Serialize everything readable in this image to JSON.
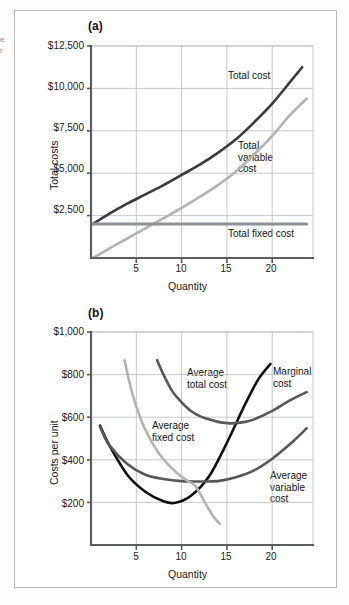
{
  "figure": {
    "edge_scrap_text": "e\nr",
    "panels": [
      {
        "id": "panel-a",
        "label": "(a)",
        "ylabel": "Total costs",
        "xlabel": "Quantity",
        "ytick_labels": [
          "$12,500",
          "$10,000",
          "$7,500",
          "$5,000",
          "$2,500"
        ],
        "xtick_labels": [
          "5",
          "10",
          "15",
          "20"
        ],
        "curve_labels": [
          {
            "name": "total-cost",
            "text": "Total cost"
          },
          {
            "name": "total-variable-cost",
            "text": "Total\nvariable\ncost"
          },
          {
            "name": "total-fixed-cost",
            "text": "Total fixed cost"
          }
        ]
      },
      {
        "id": "panel-b",
        "label": "(b)",
        "ylabel": "Costs per unit",
        "xlabel": "Quantity",
        "ytick_labels": [
          "$1,000",
          "$800",
          "$600",
          "$400",
          "$200"
        ],
        "xtick_labels": [
          "5",
          "10",
          "15",
          "20"
        ],
        "curve_labels": [
          {
            "name": "average-total-cost",
            "text": "Average\ntotal cost"
          },
          {
            "name": "marginal-cost",
            "text": "Marginal\ncost"
          },
          {
            "name": "average-fixed-cost",
            "text": "Average\nfixed cost"
          },
          {
            "name": "average-variable-cost",
            "text": "Average\nvariable\ncost"
          }
        ]
      }
    ]
  },
  "colors": {
    "dark": "#3b3b3b",
    "black": "#101010",
    "mid_gray": "#585858",
    "light_gray": "#b3b3b3",
    "grid": "#b7bbc0",
    "axis": "#5a5d61",
    "frame": "#b9bcc0"
  },
  "chart_data": [
    {
      "type": "line",
      "title": "(a)",
      "xlabel": "Quantity",
      "ylabel": "Total costs",
      "xlim": [
        0,
        24.5
      ],
      "ylim": [
        0,
        12500
      ],
      "xticks": [
        5,
        10,
        15,
        20
      ],
      "xtick_labels": [
        "5",
        "10",
        "15",
        "20"
      ],
      "yticks": [
        2500,
        5000,
        7500,
        10000,
        12500
      ],
      "ytick_labels": [
        "$2,500",
        "$5,000",
        "$7,500",
        "$10,000",
        "$12,500"
      ],
      "grid": true,
      "legend": "inline-annotations",
      "series": [
        {
          "name": "Total cost",
          "color": "#3b3b3b",
          "x": [
            0.2,
            2,
            4,
            6,
            8,
            10,
            12,
            14,
            16,
            18,
            20,
            22,
            23.3
          ],
          "values": [
            2000,
            2600,
            3200,
            3750,
            4300,
            4900,
            5500,
            6200,
            7000,
            8000,
            9100,
            10400,
            11250
          ]
        },
        {
          "name": "Total variable cost",
          "color": "#b3b3b3",
          "x": [
            0.2,
            2,
            4,
            6,
            8,
            10,
            12,
            14,
            16,
            18,
            20,
            22,
            23.8
          ],
          "values": [
            0,
            550,
            1150,
            1750,
            2350,
            2950,
            3600,
            4300,
            5100,
            6100,
            7200,
            8450,
            9400
          ]
        },
        {
          "name": "Total fixed cost",
          "color": "#8e9195",
          "x": [
            0.2,
            23.8
          ],
          "values": [
            2000,
            2000
          ]
        }
      ]
    },
    {
      "type": "line",
      "title": "(b)",
      "xlabel": "Quantity",
      "ylabel": "Costs per unit",
      "xlim": [
        0,
        24.5
      ],
      "ylim": [
        0,
        1000
      ],
      "xticks": [
        5,
        10,
        15,
        20
      ],
      "xtick_labels": [
        "5",
        "10",
        "15",
        "20"
      ],
      "yticks": [
        200,
        400,
        600,
        800,
        1000
      ],
      "ytick_labels": [
        "$200",
        "$400",
        "$600",
        "$800",
        "$1,000"
      ],
      "grid": true,
      "legend": "inline-annotations",
      "series": [
        {
          "name": "Marginal cost",
          "color": "#101010",
          "x": [
            1.0,
            2,
            4,
            6,
            8,
            9.3,
            11,
            13,
            15,
            17,
            18.5,
            19.8
          ],
          "values": [
            560,
            470,
            330,
            250,
            205,
            198,
            230,
            320,
            480,
            660,
            780,
            850
          ]
        },
        {
          "name": "Average variable cost",
          "color": "#585858",
          "x": [
            1.0,
            2,
            4,
            6,
            8,
            10,
            12,
            14,
            16,
            18,
            20,
            22,
            23.8
          ],
          "values": [
            555,
            470,
            380,
            330,
            310,
            300,
            298,
            300,
            318,
            350,
            405,
            475,
            548
          ]
        },
        {
          "name": "Average total cost",
          "color": "#585858",
          "x": [
            7.3,
            8,
            9,
            10,
            11,
            12,
            13,
            14,
            15,
            16,
            17,
            18,
            20,
            22,
            23.8
          ],
          "values": [
            868,
            800,
            720,
            670,
            630,
            605,
            590,
            578,
            572,
            572,
            578,
            590,
            630,
            680,
            718
          ]
        },
        {
          "name": "Average fixed cost",
          "color": "#b3b3b3",
          "x": [
            3.7,
            4.5,
            5.5,
            6.5,
            7.5,
            8.5,
            9.5,
            10.5,
            11.5,
            12.5,
            13.5,
            14.2
          ],
          "values": [
            868,
            720,
            590,
            498,
            430,
            378,
            338,
            305,
            278,
            205,
            135,
            100
          ]
        }
      ]
    }
  ]
}
